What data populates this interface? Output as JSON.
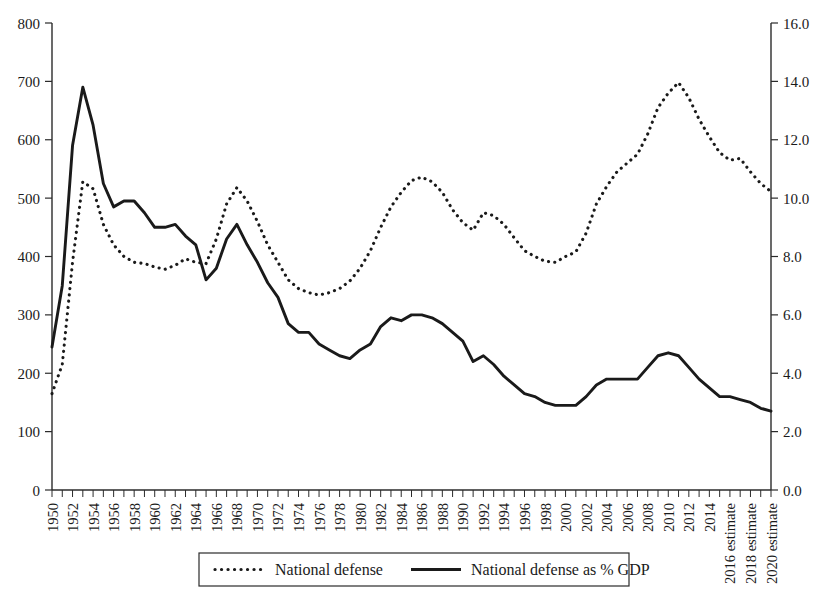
{
  "chart_data": {
    "type": "line",
    "title": "",
    "subtitle": "",
    "xlabel": "",
    "ylabel": "",
    "y2label": "",
    "grid": false,
    "legend_position": "bottom",
    "x": [
      "1950",
      "1951",
      "1952",
      "1953",
      "1954",
      "1955",
      "1956",
      "1957",
      "1958",
      "1959",
      "1960",
      "1961",
      "1962",
      "1963",
      "1964",
      "1965",
      "1966",
      "1967",
      "1968",
      "1969",
      "1970",
      "1971",
      "1972",
      "1973",
      "1974",
      "1975",
      "1976",
      "1977",
      "1978",
      "1979",
      "1980",
      "1981",
      "1982",
      "1983",
      "1984",
      "1985",
      "1986",
      "1987",
      "1988",
      "1989",
      "1990",
      "1991",
      "1992",
      "1993",
      "1994",
      "1995",
      "1996",
      "1997",
      "1998",
      "1999",
      "2000",
      "2001",
      "2002",
      "2003",
      "2004",
      "2005",
      "2006",
      "2007",
      "2008",
      "2009",
      "2010",
      "2011",
      "2012",
      "2013",
      "2014",
      "2015",
      "2016 estimate",
      "2017",
      "2018 estimate",
      "2019",
      "2020 estimate"
    ],
    "xtick_labels": [
      "1950",
      "1952",
      "1954",
      "1956",
      "1958",
      "1960",
      "1962",
      "1964",
      "1966",
      "1968",
      "1970",
      "1972",
      "1974",
      "1976",
      "1978",
      "1980",
      "1982",
      "1984",
      "1986",
      "1988",
      "1990",
      "1992",
      "1994",
      "1996",
      "1998",
      "2000",
      "2002",
      "2004",
      "2006",
      "2008",
      "2010",
      "2012",
      "2014",
      "2016 estimate",
      "2018 estimate",
      "2020 estimate"
    ],
    "xlim": [
      "1950",
      "2020 estimate"
    ],
    "ylim": [
      0,
      800
    ],
    "ytick_labels": [
      "0",
      "100",
      "200",
      "300",
      "400",
      "500",
      "600",
      "700",
      "800"
    ],
    "y2lim": [
      0.0,
      16.0
    ],
    "y2tick_labels": [
      "0.0",
      "2.0",
      "4.0",
      "6.0",
      "8.0",
      "10.0",
      "12.0",
      "14.0",
      "16.0"
    ],
    "series": [
      {
        "name": "National defense",
        "axis": "left",
        "style": "dotted",
        "color": "#1a1a1a",
        "values": [
          165,
          215,
          390,
          528,
          516,
          455,
          420,
          400,
          390,
          388,
          382,
          378,
          385,
          396,
          390,
          388,
          430,
          490,
          518,
          495,
          460,
          420,
          390,
          360,
          345,
          338,
          334,
          338,
          345,
          358,
          380,
          410,
          450,
          485,
          510,
          530,
          536,
          528,
          510,
          480,
          458,
          445,
          475,
          470,
          455,
          432,
          410,
          400,
          392,
          390,
          400,
          408,
          440,
          490,
          520,
          545,
          560,
          575,
          610,
          655,
          680,
          698,
          672,
          635,
          605,
          578,
          565,
          568,
          545,
          525,
          511
        ]
      },
      {
        "name": "National defense as % GDP",
        "axis": "right",
        "style": "solid",
        "color": "#1a1a1a",
        "values": [
          4.9,
          7.0,
          11.8,
          13.8,
          12.5,
          10.5,
          9.7,
          9.9,
          9.9,
          9.5,
          9.0,
          9.0,
          9.1,
          8.7,
          8.4,
          7.2,
          7.6,
          8.6,
          9.1,
          8.4,
          7.8,
          7.1,
          6.6,
          5.7,
          5.4,
          5.4,
          5.0,
          4.8,
          4.6,
          4.5,
          4.8,
          5.0,
          5.6,
          5.9,
          5.8,
          6.0,
          6.0,
          5.9,
          5.7,
          5.4,
          5.1,
          4.4,
          4.6,
          4.3,
          3.9,
          3.6,
          3.3,
          3.2,
          3.0,
          2.9,
          2.9,
          2.9,
          3.2,
          3.6,
          3.8,
          3.8,
          3.8,
          3.8,
          4.2,
          4.6,
          4.7,
          4.6,
          4.2,
          3.8,
          3.5,
          3.2,
          3.2,
          3.1,
          3.0,
          2.8,
          2.7
        ]
      }
    ]
  },
  "axes": {
    "left": {
      "ticks": [
        "0",
        "100",
        "200",
        "300",
        "400",
        "500",
        "600",
        "700",
        "800"
      ]
    },
    "right": {
      "ticks": [
        "0.0",
        "2.0",
        "4.0",
        "6.0",
        "8.0",
        "10.0",
        "12.0",
        "14.0",
        "16.0"
      ]
    }
  },
  "legend": {
    "entries": [
      {
        "label": "National defense",
        "marker": "dotted-line"
      },
      {
        "label": "National defense as % GDP",
        "marker": "solid-line"
      }
    ]
  }
}
